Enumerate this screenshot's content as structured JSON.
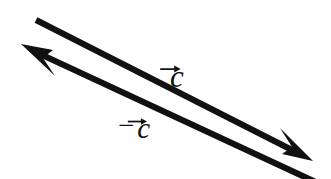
{
  "figure": {
    "background_color": "#ffffff",
    "stroke_color": "#111111",
    "width": 331,
    "height": 179
  },
  "diagram_data": {
    "type": "vector-diagram",
    "description": "Two antiparallel vectors of equal length drawn as parallel arrows; the upper arrow points down-right and is labelled c with a vector arrow, the lower arrow points up-left and is labelled minus c with a vector arrow.",
    "vectors": [
      {
        "id": "c",
        "label": "c",
        "sign": "",
        "has_overarrow": true,
        "direction": "down-right",
        "tail": [
          36,
          20
        ],
        "tip": [
          312,
          160
        ],
        "slope": 0.555,
        "stroke_width": 6,
        "arrowhead": "barbed"
      },
      {
        "id": "-c",
        "label": "c",
        "sign": "−",
        "has_overarrow": true,
        "direction": "up-left",
        "tail": [
          320,
          183
        ],
        "tip": [
          22,
          45
        ],
        "slope": 0.555,
        "stroke_width": 6,
        "arrowhead": "barbed"
      }
    ],
    "labels": [
      {
        "id": "label-c",
        "text": "c",
        "sign": "",
        "x": 170,
        "y": 61
      },
      {
        "id": "label-neg-c",
        "text": "c",
        "sign": "−",
        "x": 118,
        "y": 111
      }
    ]
  }
}
